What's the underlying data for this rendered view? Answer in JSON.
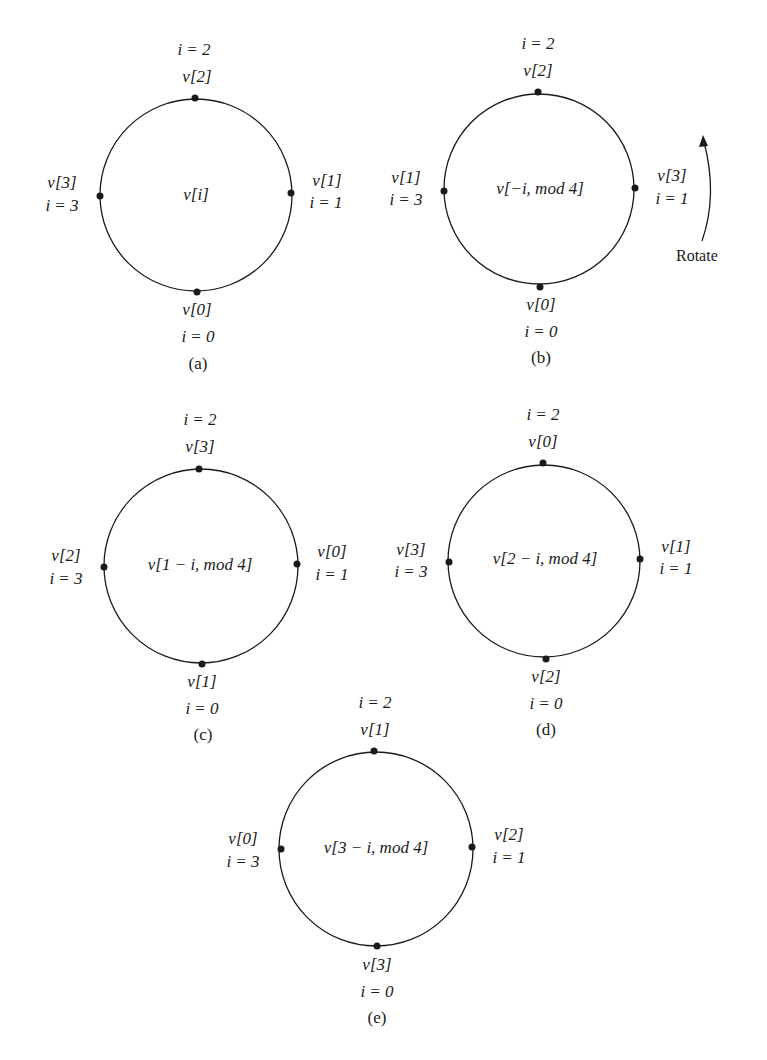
{
  "figure": {
    "panels": [
      {
        "id": "a",
        "caption": "(a)",
        "center_expr": "v[i]",
        "top": {
          "i": "i = 2",
          "v": "v[2]"
        },
        "right": {
          "v": "v[1]",
          "i": "i = 1"
        },
        "bottom": {
          "v": "v[0]",
          "i": "i = 0"
        },
        "left": {
          "v": "v[3]",
          "i": "i = 3"
        }
      },
      {
        "id": "b",
        "caption": "(b)",
        "center_expr": "v[−i, mod 4]",
        "top": {
          "i": "i = 2",
          "v": "v[2]"
        },
        "right": {
          "v": "v[3]",
          "i": "i = 1"
        },
        "bottom": {
          "v": "v[0]",
          "i": "i = 0"
        },
        "left": {
          "v": "v[1]",
          "i": "i = 3"
        },
        "annotation": "Rotate"
      },
      {
        "id": "c",
        "caption": "(c)",
        "center_expr": "v[1 − i, mod 4]",
        "top": {
          "i": "i = 2",
          "v": "v[3]"
        },
        "right": {
          "v": "v[0]",
          "i": "i = 1"
        },
        "bottom": {
          "v": "v[1]",
          "i": "i = 0"
        },
        "left": {
          "v": "v[2]",
          "i": "i = 3"
        }
      },
      {
        "id": "d",
        "caption": "(d)",
        "center_expr": "v[2 − i, mod 4]",
        "top": {
          "i": "i = 2",
          "v": "v[0]"
        },
        "right": {
          "v": "v[1]",
          "i": "i = 1"
        },
        "bottom": {
          "v": "v[2]",
          "i": "i = 0"
        },
        "left": {
          "v": "v[3]",
          "i": "i = 3"
        }
      },
      {
        "id": "e",
        "caption": "(e)",
        "center_expr": "v[3 − i, mod 4]",
        "top": {
          "i": "i = 2",
          "v": "v[1]"
        },
        "right": {
          "v": "v[2]",
          "i": "i = 1"
        },
        "bottom": {
          "v": "v[3]",
          "i": "i = 0"
        },
        "left": {
          "v": "v[0]",
          "i": "i = 3"
        }
      }
    ]
  },
  "colors": {
    "ink": "#1a1a1a",
    "background": "#ffffff"
  }
}
